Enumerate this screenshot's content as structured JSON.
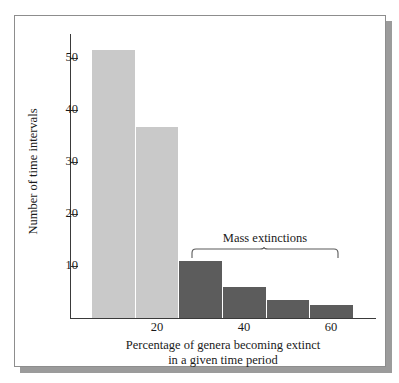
{
  "figure": {
    "frame_border_color": "#8d8d8d",
    "shadow_color": "#9b9b9b",
    "background": "#ffffff"
  },
  "chart_data": {
    "type": "bar",
    "title": "",
    "subtitle": "",
    "xlabel": "Percentage of genera becoming extinct in a given time period",
    "xlabel_line1": "Percentage of genera becoming extinct",
    "xlabel_line2": "in a given time period",
    "ylabel": "Number of time intervals",
    "xlim": [
      0,
      70
    ],
    "ylim": [
      0,
      55
    ],
    "grid": false,
    "legend": false,
    "x_ticks": [
      20,
      40,
      60
    ],
    "x_tick_labels": [
      "20",
      "40",
      "60"
    ],
    "y_ticks": [
      10,
      20,
      30,
      40,
      50
    ],
    "y_tick_labels": [
      "10",
      "20",
      "30",
      "40",
      "50"
    ],
    "bin_width": 10,
    "categories": [
      "5-15",
      "15-25",
      "25-35",
      "35-45",
      "45-55",
      "55-65"
    ],
    "bin_starts": [
      5,
      15,
      25,
      35,
      45,
      55
    ],
    "values": [
      52,
      37,
      11,
      6,
      3.5,
      2.5
    ],
    "bar_colors": [
      "#c9c9c9",
      "#c9c9c9",
      "#5c5c5c",
      "#5c5c5c",
      "#5c5c5c",
      "#5c5c5c"
    ],
    "color_light": "#c9c9c9",
    "color_dark": "#5c5c5c",
    "axis_color": "#3a3a3a",
    "annotations": [
      {
        "text": "Mass extinctions",
        "type": "brace",
        "covers_bins": [
          2,
          3,
          4,
          5
        ],
        "x_range": [
          25,
          65
        ]
      }
    ]
  },
  "annotation": {
    "mass_extinctions_label": "Mass extinctions"
  }
}
